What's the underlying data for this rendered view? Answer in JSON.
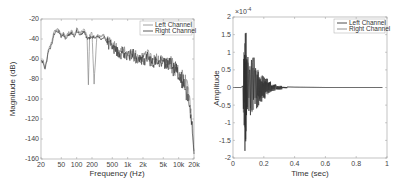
{
  "chart_data": [
    {
      "type": "line",
      "note": "Trace values are approximate estimates read from a low-resolution (408x190) noisy plot; axis ranges, ticks, and legend are read directly.",
      "title": "",
      "xlabel": "Frequency (Hz)",
      "ylabel": "Magnitude (dB)",
      "xscale": "log",
      "xlim": [
        20,
        20000
      ],
      "ylim": [
        -160,
        -20
      ],
      "xticks": [
        20,
        50,
        100,
        200,
        500,
        1000,
        2000,
        5000,
        10000,
        20000
      ],
      "xtick_labels": [
        "20",
        "50",
        "100",
        "200",
        "500",
        "1k",
        "2k",
        "5k",
        "10k",
        "20k"
      ],
      "yticks": [
        -20,
        -40,
        -60,
        -80,
        -100,
        -120,
        -140,
        -160
      ],
      "ytick_labels": [
        "-20",
        "-40",
        "-60",
        "-80",
        "-100",
        "-120",
        "-140",
        "-160"
      ],
      "grid": false,
      "legend_position": "upper right",
      "series": [
        {
          "name": "Left Channel",
          "color": "#888888",
          "x": [
            20,
            22,
            24,
            26,
            28,
            30,
            33,
            36,
            40,
            45,
            50,
            55,
            60,
            70,
            80,
            90,
            100,
            110,
            120,
            140,
            160,
            170,
            180,
            200,
            220,
            250,
            300,
            350,
            400,
            500,
            600,
            700,
            800,
            1000,
            1200,
            1500,
            2000,
            2500,
            3000,
            4000,
            5000,
            6000,
            8000,
            10000,
            12000,
            15000,
            17000,
            19000,
            20000
          ],
          "y": [
            -60,
            -62,
            -68,
            -60,
            -50,
            -48,
            -42,
            -32,
            -30,
            -31,
            -36,
            -34,
            -38,
            -34,
            -32,
            -36,
            -30,
            -32,
            -34,
            -30,
            -38,
            -86,
            -36,
            -34,
            -84,
            -36,
            -38,
            -36,
            -42,
            -46,
            -50,
            -54,
            -52,
            -56,
            -52,
            -58,
            -60,
            -56,
            -62,
            -60,
            -62,
            -64,
            -68,
            -72,
            -78,
            -90,
            -110,
            -130,
            -152
          ]
        },
        {
          "name": "Right Channel",
          "color": "#333333",
          "x": [
            20,
            22,
            24,
            26,
            28,
            30,
            33,
            36,
            40,
            45,
            50,
            55,
            60,
            70,
            80,
            90,
            100,
            110,
            120,
            140,
            160,
            200,
            250,
            300,
            350,
            400,
            500,
            600,
            700,
            800,
            1000,
            1200,
            1500,
            2000,
            2500,
            3000,
            4000,
            5000,
            6000,
            8000,
            10000,
            12000,
            15000,
            17000,
            19000,
            20000
          ],
          "y": [
            -62,
            -64,
            -70,
            -62,
            -52,
            -50,
            -44,
            -35,
            -32,
            -33,
            -38,
            -36,
            -40,
            -36,
            -34,
            -38,
            -32,
            -34,
            -36,
            -32,
            -40,
            -38,
            -38,
            -40,
            -38,
            -44,
            -48,
            -52,
            -56,
            -54,
            -58,
            -54,
            -60,
            -62,
            -58,
            -64,
            -62,
            -64,
            -66,
            -70,
            -74,
            -82,
            -96,
            -115,
            -135,
            -155
          ]
        }
      ]
    },
    {
      "type": "line",
      "note": "Trace values are approximate estimates read from a low-resolution (408x190) noisy plot; axis ranges, ticks, and legend are read directly.",
      "title": "",
      "xlabel": "Time (sec)",
      "ylabel": "Amplitude",
      "y_multiplier": "x10^-4",
      "xlim": [
        0,
        1
      ],
      "ylim": [
        -2,
        2
      ],
      "xticks": [
        0,
        0.2,
        0.4,
        0.6,
        0.8,
        1
      ],
      "xtick_labels": [
        "0",
        "0.2",
        "0.4",
        "0.6",
        "0.8",
        "1"
      ],
      "yticks": [
        2,
        1.5,
        1,
        0.5,
        0,
        -0.5,
        -1,
        -1.5,
        -2
      ],
      "ytick_labels": [
        "2",
        "1.5",
        "1",
        "0.5",
        "0",
        "-0.5",
        "-1",
        "-1.5",
        "-2"
      ],
      "grid": false,
      "legend_position": "upper right",
      "series": [
        {
          "name": "Left Channel",
          "color": "#222222",
          "x": [
            0,
            0.05,
            0.06,
            0.065,
            0.07,
            0.075,
            0.08,
            0.085,
            0.09,
            0.1,
            0.11,
            0.12,
            0.13,
            0.14,
            0.15,
            0.17,
            0.19,
            0.21,
            0.23,
            0.25,
            0.28,
            0.32,
            0.4,
            0.6,
            0.8,
            0.97
          ],
          "y": [
            0,
            0,
            0.02,
            0.05,
            1.05,
            -1.2,
            1.8,
            -1.55,
            0.9,
            -0.7,
            0.65,
            -0.8,
            0.85,
            -0.55,
            0.6,
            -0.4,
            0.35,
            -0.25,
            0.18,
            -0.1,
            0.06,
            0.02,
            0.01,
            0,
            0,
            0
          ]
        },
        {
          "name": "Right Channel",
          "color": "#777777",
          "x": [
            0,
            0.05,
            0.06,
            0.065,
            0.07,
            0.075,
            0.08,
            0.085,
            0.09,
            0.1,
            0.11,
            0.12,
            0.13,
            0.14,
            0.15,
            0.17,
            0.19,
            0.21,
            0.23,
            0.25,
            0.28,
            0.32,
            0.4,
            0.6,
            0.8,
            0.97
          ],
          "y": [
            0,
            0,
            0.02,
            0.04,
            0.9,
            -1.0,
            1.5,
            -1.3,
            0.8,
            -0.6,
            0.55,
            -0.7,
            0.7,
            -0.45,
            0.5,
            -0.35,
            0.3,
            -0.2,
            0.15,
            -0.08,
            0.05,
            0.02,
            0.01,
            0,
            0,
            0
          ]
        }
      ]
    }
  ],
  "left_plot": {
    "xlabel": "Frequency (Hz)",
    "ylabel": "Magnitude (dB)",
    "legend": [
      "Left Channel",
      "Right Channel"
    ]
  },
  "right_plot": {
    "xlabel": "Time (sec)",
    "ylabel": "Amplitude",
    "multiplier": "×10",
    "multiplier_exp": "-4",
    "legend": [
      "Left Channel",
      "Right Channel"
    ]
  }
}
